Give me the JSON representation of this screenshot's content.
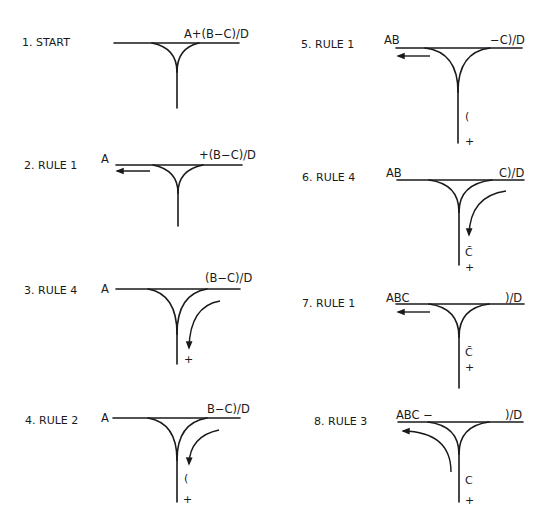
{
  "diagram": {
    "colors": {
      "ink": "#1a1a1a",
      "background": "#ffffff"
    },
    "panels": [
      {
        "id": 1,
        "label": "1. START",
        "output": "",
        "input": "A+(B−C)/D",
        "stack": [],
        "arrow": "none",
        "label_pos": [
          22,
          46
        ],
        "output_pos": [
          0,
          0
        ],
        "input_pos": [
          184,
          38
        ],
        "line": [
          114,
          239,
          43
        ],
        "junction": [
          152,
          197,
          177,
          72
        ],
        "stem_end": 108
      },
      {
        "id": 2,
        "label": "2. RULE 1",
        "output": "A",
        "input": "+(B−C)/D",
        "stack": [],
        "arrow": "left",
        "label_pos": [
          24,
          165
        ],
        "output_pos": [
          103,
          162
        ],
        "input_pos": [
          199,
          159
        ],
        "line": [
          116,
          242,
          165
        ],
        "junction": [
          153,
          200,
          178,
          193
        ],
        "stem_end": 226,
        "arrow_coords": [
          150,
          171,
          117
        ]
      },
      {
        "id": 3,
        "label": "3. RULE 4",
        "output": "A",
        "input": "(B−C)/D",
        "stack": [
          "+"
        ],
        "arrow": "down-curve",
        "label_pos": [
          24,
          291
        ],
        "output_pos": [
          103,
          291
        ],
        "input_pos": [
          205,
          280
        ],
        "line": [
          116,
          240,
          289
        ],
        "junction": [
          150,
          205,
          177,
          334
        ],
        "stem_end": 363,
        "stack_pos": [
          [
            189,
            362
          ]
        ],
        "arrow_coords": [
          220,
          301,
          189,
          350
        ]
      },
      {
        "id": 4,
        "label": "4. RULE 2",
        "output": "A",
        "input": "B−C)/D",
        "stack": [
          "(",
          "+"
        ],
        "arrow": "down-curve",
        "label_pos": [
          25,
          421
        ],
        "output_pos": [
          103,
          421
        ],
        "input_pos": [
          207,
          412
        ],
        "line": [
          113,
          240,
          418
        ],
        "junction": [
          150,
          205,
          177,
          460
        ],
        "stem_end": 502,
        "stack_pos": [
          [
            185,
            479
          ],
          [
            188,
            502
          ]
        ],
        "arrow_coords": [
          219,
          430,
          189,
          465
        ]
      },
      {
        "id": 5,
        "label": "5. RULE 1",
        "output": "AB",
        "input": "−C)/D",
        "stack": [
          "(",
          "+"
        ],
        "arrow": "left",
        "label_pos": [
          301,
          47
        ],
        "output_pos": [
          384,
          43
        ],
        "input_pos": [
          490,
          43
        ],
        "line": [
          396,
          522,
          48
        ],
        "junction": [
          427,
          488,
          458,
          90
        ],
        "stem_end": 142,
        "stack_pos": [
          [
            466,
            119
          ],
          [
            466,
            144
          ]
        ],
        "arrow_coords": [
          430,
          56,
          398
        ]
      },
      {
        "id": 6,
        "label": "6. RULE 4",
        "output": "AB",
        "input": "C)/D",
        "stack": [
          "C̄",
          "+"
        ],
        "arrow": "down-curve",
        "label_pos": [
          302,
          179
        ],
        "output_pos": [
          386,
          177
        ],
        "input_pos": [
          499,
          177
        ],
        "line": [
          397,
          524,
          180
        ],
        "junction": [
          430,
          490,
          459,
          210
        ],
        "stem_end": 265,
        "stack_pos": [
          [
            466,
            253
          ],
          [
            466,
            270
          ]
        ],
        "arrow_coords": [
          506,
          191,
          469,
          236
        ]
      },
      {
        "id": 7,
        "label": "7. RULE 1",
        "output": "ABC",
        "input": ")/D",
        "stack": [
          "C̄",
          "+"
        ],
        "arrow": "left",
        "label_pos": [
          302,
          306
        ],
        "output_pos": [
          386,
          302
        ],
        "input_pos": [
          505,
          302
        ],
        "line": [
          396,
          524,
          304
        ],
        "junction": [
          431,
          487,
          459,
          335
        ],
        "stem_end": 388,
        "stack_pos": [
          [
            465,
            354
          ],
          [
            465,
            370
          ]
        ],
        "arrow_coords": [
          430,
          312,
          398
        ]
      },
      {
        "id": 8,
        "label": "8. RULE 3",
        "output": "ABC −",
        "input": ")/D",
        "stack": [
          "C",
          "+"
        ],
        "arrow": "up-left-curve",
        "label_pos": [
          314,
          422
        ],
        "output_pos": [
          396,
          419
        ],
        "input_pos": [
          505,
          419
        ],
        "line": [
          398,
          523,
          422
        ],
        "junction": [
          428,
          487,
          459,
          452
        ],
        "stem_end": 502,
        "stack_pos": [
          [
            466,
            483
          ],
          [
            466,
            503
          ]
        ],
        "arrow_coords": [
          451,
          472,
          402,
          431
        ]
      }
    ]
  }
}
